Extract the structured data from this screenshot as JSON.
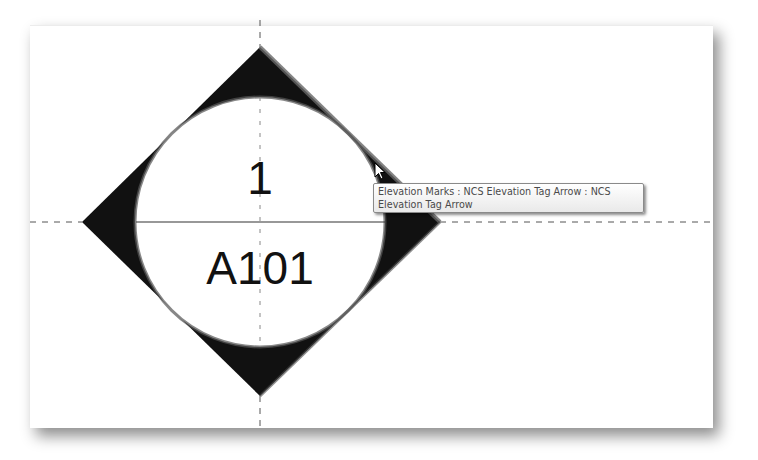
{
  "drawing": {
    "tag": {
      "type": "elevation-mark",
      "detail_number": "1",
      "sheet_number": "A101",
      "highlighted_edge": "top-right"
    },
    "colors": {
      "fill": "#111111",
      "highlight": "#555555",
      "gridline": "#555555",
      "panel": "#ffffff"
    }
  },
  "tooltip": {
    "line1": "Elevation Marks : NCS Elevation Tag Arrow : NCS",
    "line2": "Elevation Tag Arrow"
  },
  "cursor": {
    "icon": "arrow-pointer-icon"
  }
}
